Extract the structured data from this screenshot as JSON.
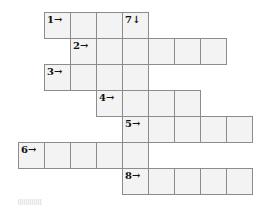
{
  "puzzle": {
    "cell_size": 26,
    "origin": {
      "x": 18,
      "y": 12
    },
    "colors": {
      "cell_fill": "#f3f3f3",
      "cell_border": "#8c8c8c",
      "label": "#111111"
    },
    "entries": [
      {
        "number": 1,
        "direction": "across",
        "label": "1→",
        "row": 0,
        "col": 1,
        "length": 4
      },
      {
        "number": 2,
        "direction": "across",
        "label": "2→",
        "row": 1,
        "col": 2,
        "length": 6
      },
      {
        "number": 3,
        "direction": "across",
        "label": "3→",
        "row": 2,
        "col": 1,
        "length": 4
      },
      {
        "number": 4,
        "direction": "across",
        "label": "4→",
        "row": 3,
        "col": 3,
        "length": 4
      },
      {
        "number": 5,
        "direction": "across",
        "label": "5→",
        "row": 4,
        "col": 4,
        "length": 5
      },
      {
        "number": 6,
        "direction": "across",
        "label": "6→",
        "row": 5,
        "col": 0,
        "length": 5
      },
      {
        "number": 7,
        "direction": "down",
        "label": "7↓",
        "row": 0,
        "col": 4,
        "length": 7
      },
      {
        "number": 8,
        "direction": "across",
        "label": "8→",
        "row": 6,
        "col": 4,
        "length": 5
      }
    ]
  }
}
